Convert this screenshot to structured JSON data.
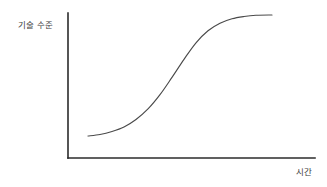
{
  "figure": {
    "background_color": "#ffffff",
    "axis_color": "#2b2b2b",
    "curve_color": "#4a4a4a"
  },
  "labels": {
    "y_axis": "기술 수준",
    "x_axis": "시간"
  },
  "chart_data": {
    "type": "line",
    "title": "",
    "subtitle": "",
    "xlabel": "시간",
    "ylabel": "기술 수준",
    "grid": false,
    "legend": null,
    "annotations": [],
    "xlim": [
      0,
      1
    ],
    "ylim": [
      0,
      1
    ],
    "x_ticks": [],
    "y_ticks": [],
    "series": [
      {
        "name": "기술 수준",
        "shape": "sigmoid",
        "x": [
          0.08,
          0.14,
          0.2,
          0.26,
          0.32,
          0.38,
          0.44,
          0.5,
          0.56,
          0.62,
          0.68,
          0.74,
          0.8,
          0.86,
          0.92,
          1.0
        ],
        "y": [
          0.155,
          0.165,
          0.185,
          0.215,
          0.265,
          0.335,
          0.43,
          0.545,
          0.665,
          0.775,
          0.855,
          0.905,
          0.935,
          0.95,
          0.958,
          0.96
        ]
      }
    ]
  },
  "geometry": {
    "y_axis_x": 68,
    "y_axis_top": 13,
    "axis_baseline_y": 158,
    "x_axis_right": 315,
    "curve_start_x": 88,
    "curve_start_y": 136,
    "curve_end_x": 272,
    "curve_end_y": 15
  }
}
